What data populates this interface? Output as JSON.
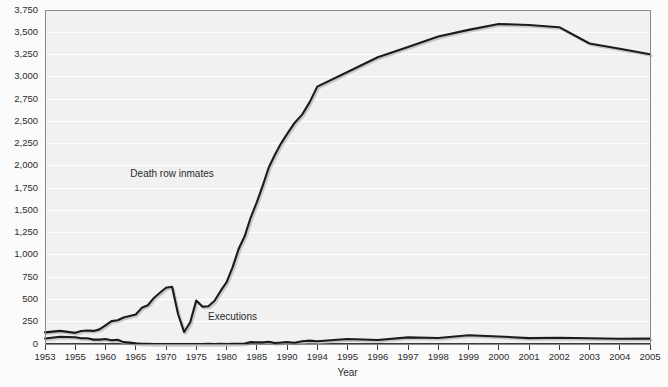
{
  "chart_data": {
    "type": "line",
    "title": "",
    "xlabel": "Year",
    "ylabel": "",
    "grid": true,
    "legend_position": "inline-annotation",
    "xlim": [
      1953,
      2005
    ],
    "ylim": [
      0,
      3750
    ],
    "ytick_labels": [
      "0",
      "250",
      "500",
      "750",
      "1,000",
      "1,250",
      "1,500",
      "1,750",
      "2,000",
      "2,250",
      "2,500",
      "2,750",
      "3,000",
      "3,250",
      "3,500",
      "3,750"
    ],
    "ytick_values": [
      0,
      250,
      500,
      750,
      1000,
      1250,
      1500,
      1750,
      2000,
      2250,
      2500,
      2750,
      3000,
      3250,
      3500,
      3750
    ],
    "xtick_labels": [
      "1953",
      "1955",
      "1960",
      "1965",
      "1970",
      "1975",
      "1980",
      "1985",
      "1990",
      "1994",
      "1995",
      "1996",
      "1997",
      "1998",
      "1999",
      "2000",
      "2001",
      "2002",
      "2003",
      "2004",
      "2005"
    ],
    "xtick_values": [
      1953,
      1955,
      1960,
      1965,
      1970,
      1975,
      1980,
      1985,
      1990,
      1994,
      1995,
      1996,
      1997,
      1998,
      1999,
      2000,
      2001,
      2002,
      2003,
      2004,
      2005
    ],
    "annotations": [
      {
        "text": "Death row inmates",
        "x": 1971,
        "y": 1880
      },
      {
        "text": "Executions",
        "x": 1981,
        "y": 270
      }
    ],
    "x": [
      1953,
      1954,
      1955,
      1956,
      1957,
      1958,
      1959,
      1960,
      1961,
      1962,
      1963,
      1964,
      1965,
      1966,
      1967,
      1968,
      1969,
      1970,
      1971,
      1972,
      1973,
      1974,
      1975,
      1976,
      1977,
      1978,
      1979,
      1980,
      1981,
      1982,
      1983,
      1984,
      1985,
      1986,
      1987,
      1988,
      1989,
      1990,
      1991,
      1992,
      1993,
      1994,
      1995,
      1996,
      1997,
      1998,
      1999,
      2000,
      2001,
      2002,
      2003,
      2004,
      2005
    ],
    "series": [
      {
        "name": "Death row inmates",
        "color": "#1b1b1b",
        "values": [
          131,
          147,
          125,
          146,
          151,
          147,
          164,
          210,
          257,
          267,
          297,
          315,
          331,
          406,
          435,
          517,
          575,
          631,
          642,
          334,
          134,
          244,
          488,
          420,
          423,
          482,
          593,
          692,
          860,
          1066,
          1209,
          1420,
          1591,
          1781,
          1984,
          2124,
          2250,
          2356,
          2482,
          2575,
          2716,
          2890,
          3054,
          3219,
          3335,
          3452,
          3527,
          3593,
          3581,
          3557,
          3374,
          3315,
          3254
        ]
      },
      {
        "name": "Executions",
        "color": "#1b1b1b",
        "values": [
          62,
          81,
          76,
          65,
          65,
          49,
          49,
          56,
          42,
          47,
          21,
          15,
          7,
          1,
          2,
          0,
          0,
          0,
          0,
          0,
          0,
          0,
          0,
          0,
          1,
          0,
          2,
          0,
          1,
          2,
          5,
          21,
          18,
          18,
          25,
          11,
          16,
          23,
          14,
          31,
          38,
          31,
          56,
          45,
          74,
          68,
          98,
          85,
          66,
          71,
          65,
          59,
          60
        ]
      }
    ],
    "notes": {
      "death_row_peak_year": 1999,
      "death_row_peak_value": 3527,
      "executions_peak_year": 1999,
      "executions_peak_value": 98,
      "death_row_trough_year": 1973,
      "death_row_trough_value": 134
    }
  },
  "labels": {
    "death_row": "Death row inmates",
    "executions": "Executions",
    "x_axis_title": "Year"
  },
  "colors": {
    "plot_background": "#f1f1f1",
    "page_background": "#fbfbfb",
    "gridline": "#ffffff",
    "line": "#1b1b1b",
    "frame": "#8a8a8a",
    "text": "#2b2b2b"
  }
}
